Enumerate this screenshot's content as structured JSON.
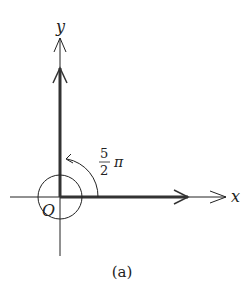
{
  "diagram": {
    "x_label": "x",
    "y_label": "y",
    "origin_label": "O",
    "angle_numerator": "5",
    "angle_denominator": "2",
    "angle_symbol": "π",
    "caption": "(a)",
    "colors": {
      "ink": "#222222",
      "background": "#ffffff"
    }
  }
}
